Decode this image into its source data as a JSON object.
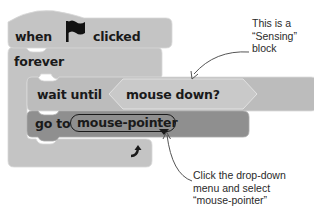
{
  "colors": {
    "block_light": "#c4c4c4",
    "block_mid": "#b7b7b7",
    "block_dark": "#8f8f8f",
    "sensing_hex": "#c9c9c9",
    "text": "#1a1a1a",
    "arrow": "#555555"
  },
  "script": {
    "hat_block": {
      "prefix": "when",
      "icon": "flag-icon",
      "suffix": "clicked"
    },
    "forever_block": {
      "label": "forever",
      "loop_icon": "loop-arrow-icon"
    },
    "wait_block": {
      "label": "wait until",
      "condition": "mouse down?"
    },
    "goto_block": {
      "label": "go to",
      "dropdown_value": "mouse-pointer",
      "dropdown_icon": "dropdown-triangle-icon"
    }
  },
  "annotations": {
    "sensing_note": {
      "lines": [
        "This is a",
        "“Sensing”",
        "block"
      ]
    },
    "dropdown_note": {
      "lines": [
        "Click the drop-down",
        "menu and select",
        "“mouse-pointer”"
      ]
    }
  }
}
